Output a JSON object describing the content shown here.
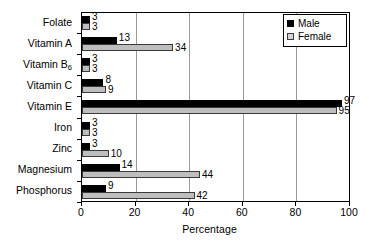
{
  "chart_data": {
    "type": "bar",
    "orientation": "horizontal",
    "title": "",
    "xlabel": "Percentage",
    "ylabel": "",
    "xlim": [
      0,
      100
    ],
    "xticks": [
      0,
      20,
      40,
      60,
      80,
      100
    ],
    "grid": true,
    "grid_axis": "x",
    "legend_position": "top-right",
    "categories": [
      "Phosphorus",
      "Magnesium",
      "Zinc",
      "Iron",
      "Vitamin E",
      "Vitamin C",
      "Vitamin B6",
      "Vitamin A",
      "Folate"
    ],
    "series": [
      {
        "name": "Male",
        "color": "#000000",
        "values": [
          9,
          14,
          3,
          3,
          97,
          8,
          3,
          13,
          3
        ]
      },
      {
        "name": "Female",
        "color": "#bebebe",
        "values": [
          42,
          44,
          10,
          3,
          95,
          9,
          3,
          34,
          3
        ]
      }
    ]
  },
  "axis": {
    "tick_labels": [
      "0",
      "20",
      "40",
      "60",
      "80",
      "100"
    ],
    "x_title": "Percentage"
  },
  "categories_display": [
    {
      "text": "Phosphorus",
      "sub": ""
    },
    {
      "text": "Magnesium",
      "sub": ""
    },
    {
      "text": "Zinc",
      "sub": ""
    },
    {
      "text": "Iron",
      "sub": ""
    },
    {
      "text": "Vitamin E",
      "sub": ""
    },
    {
      "text": "Vitamin C",
      "sub": ""
    },
    {
      "text": "Vitamin B",
      "sub": "6"
    },
    {
      "text": "Vitamin A",
      "sub": ""
    },
    {
      "text": "Folate",
      "sub": ""
    }
  ],
  "legend": {
    "items": [
      {
        "label": "Male",
        "swatch": "solid-black-swatch"
      },
      {
        "label": "Female",
        "swatch": "light-gray-swatch"
      }
    ]
  },
  "value_labels": {
    "male": [
      "9",
      "14",
      "3",
      "3",
      "97",
      "8",
      "3",
      "13",
      "3"
    ],
    "female": [
      "42",
      "44",
      "10",
      "3",
      "95",
      "9",
      "3",
      "34",
      "3"
    ]
  }
}
